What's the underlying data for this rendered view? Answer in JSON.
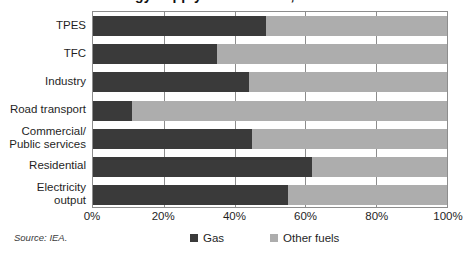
{
  "title": {
    "text": "Gas share in energy supply and demand, 2004"
  },
  "source": {
    "text": "Source: IEA."
  },
  "legend": {
    "position": "bottom",
    "items": [
      {
        "label": "Gas",
        "color": "#3a3a3a",
        "swatch_name": "gas-swatch"
      },
      {
        "label": "Other fuels",
        "color": "#adadad",
        "swatch_name": "other-fuels-swatch"
      }
    ]
  },
  "axis": {
    "ticks": [
      "0%",
      "20%",
      "40%",
      "60%",
      "80%",
      "100%"
    ],
    "tick_values": [
      0,
      20,
      40,
      60,
      80,
      100
    ]
  },
  "chart_data": {
    "type": "bar",
    "orientation": "horizontal",
    "stacked": true,
    "stack_total": 100,
    "title": "Gas share in energy supply and demand, 2004",
    "xlabel": "",
    "ylabel": "",
    "xlim": [
      0,
      100
    ],
    "grid": true,
    "grid_axis": "x",
    "legend_position": "bottom",
    "categories": [
      "TPES",
      "TFC",
      "Industry",
      "Road transport",
      "Commercial/\nPublic services",
      "Residential",
      "Electricity\noutput"
    ],
    "series": [
      {
        "name": "Gas",
        "color": "#3a3a3a",
        "values": [
          49,
          35,
          44,
          11,
          45,
          62,
          55
        ]
      },
      {
        "name": "Other fuels",
        "color": "#adadad",
        "values": [
          51,
          65,
          56,
          89,
          55,
          38,
          45
        ]
      }
    ]
  }
}
